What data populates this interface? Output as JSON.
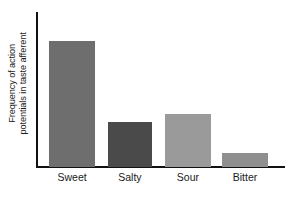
{
  "chart_data": {
    "type": "bar",
    "title": "",
    "xlabel": "",
    "ylabel": "Frequency of action potentials in taste afferent",
    "ylabel_line1": "Frequency of action",
    "ylabel_line2": "potentials in taste afferent",
    "categories": [
      "Sweet",
      "Salty",
      "Sour",
      "Bitter"
    ],
    "values": [
      81,
      29,
      34,
      9
    ],
    "ylim": [
      0,
      100
    ],
    "y_ticks": [],
    "grid": false,
    "legend": false,
    "bar_colors": [
      "#6e6e6e",
      "#4a4a4a",
      "#9a9a9a",
      "#8f8f8f"
    ],
    "axis_color": "#111111",
    "background_color": "#ffffff",
    "bars": [
      {
        "label": "Sweet",
        "value": 81,
        "color": "#6e6e6e",
        "left_pct": 4.5,
        "width_pct": 18.6
      },
      {
        "label": "Salty",
        "value": 29,
        "color": "#4a4a4a",
        "left_pct": 28.3,
        "width_pct": 17.8
      },
      {
        "label": "Sour",
        "value": 34,
        "color": "#9a9a9a",
        "left_pct": 51.4,
        "width_pct": 18.6
      },
      {
        "label": "Bitter",
        "value": 9,
        "color": "#8f8f8f",
        "left_pct": 74.5,
        "width_pct": 18.6
      }
    ]
  }
}
